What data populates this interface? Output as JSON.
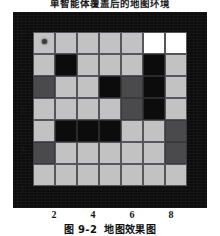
{
  "figure": {
    "title": "单智能体覆盖后的地图环境",
    "caption_number": "图 9-2",
    "caption_text": "地图效果图"
  },
  "legend_colors": {
    "free": "#c2c2c2",
    "covered": "#ffffff",
    "obstacle": "#0c0c0c",
    "visited": "#4a4a4c",
    "panel_background": "#0c0c0c",
    "grid_line": "#55565a",
    "agent_marker": "#3b3b3b"
  },
  "chart_data": {
    "type": "heatmap",
    "title": "单智能体覆盖后的地图环境",
    "xlabel": "",
    "ylabel": "",
    "grid": true,
    "legend_position": "none",
    "rows": 7,
    "cols": 7,
    "xlim": [
      1,
      9
    ],
    "ylim": [
      1,
      9
    ],
    "x_ticks": [
      "2",
      "4",
      "6",
      "8"
    ],
    "y_ticks": [
      "9",
      "7",
      "5",
      "3",
      "1"
    ],
    "x_tick_positions": [
      2,
      4,
      6,
      8
    ],
    "y_tick_positions": [
      9,
      7,
      5,
      3,
      1
    ],
    "categories": [
      "free",
      "covered",
      "obstacle",
      "visited"
    ],
    "category_values": [
      0,
      1,
      2,
      3
    ],
    "cells": [
      [
        "free",
        "free",
        "free",
        "free",
        "free",
        "covered",
        "covered"
      ],
      [
        "free",
        "obstacle",
        "free",
        "free",
        "free",
        "obstacle",
        "free"
      ],
      [
        "visited",
        "free",
        "free",
        "obstacle",
        "visited",
        "obstacle",
        "free"
      ],
      [
        "free",
        "free",
        "free",
        "free",
        "visited",
        "obstacle",
        "free"
      ],
      [
        "free",
        "obstacle",
        "obstacle",
        "obstacle",
        "free",
        "free",
        "visited"
      ],
      [
        "visited",
        "free",
        "free",
        "free",
        "free",
        "free",
        "visited"
      ],
      [
        "free",
        "free",
        "free",
        "free",
        "free",
        "free",
        "free"
      ]
    ],
    "agent": {
      "row": 0,
      "col": 0,
      "label": "agent-start-marker"
    }
  }
}
